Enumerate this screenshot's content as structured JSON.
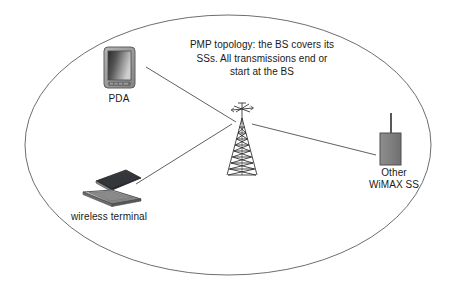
{
  "diagram": {
    "caption": "PMP topology: the BS covers its SSs. All transmissions end or start at the BS",
    "boundary": {
      "shape": "ellipse",
      "name": "coverage-area-ellipse",
      "stroke_color": "#6e6e6e",
      "fill_color": "#ffffff"
    },
    "nodes": [
      {
        "id": "pda",
        "label": "PDA",
        "icon": "pda-device-icon",
        "x": 119,
        "y": 68
      },
      {
        "id": "base-station",
        "label": "",
        "icon": "radio-tower-icon",
        "x": 242,
        "y": 145
      },
      {
        "id": "wireless-terminal",
        "label": "wireless terminal",
        "icon": "laptop-icon",
        "x": 109,
        "y": 188
      },
      {
        "id": "other-wimax-ss",
        "label": "Other\nWiMAX SS",
        "label_line1": "Other",
        "label_line2": "WiMAX SS",
        "icon": "subscriber-station-icon",
        "x": 391,
        "y": 147
      }
    ],
    "links": [
      {
        "id": "link-pda-bs",
        "from": "pda",
        "to": "base-station",
        "stroke_color": "#4d4d4d"
      },
      {
        "id": "link-terminal-bs",
        "from": "wireless-terminal",
        "to": "base-station",
        "stroke_color": "#4d4d4d"
      },
      {
        "id": "link-bs-wimax",
        "from": "base-station",
        "to": "other-wimax-ss",
        "stroke_color": "#4d4d4d"
      }
    ],
    "colors": {
      "line": "#4d4d4d",
      "ellipse": "#6e6e6e",
      "text": "#1a1a1a",
      "device_gray": "#808080",
      "device_dark": "#3a3a3a",
      "device_light": "#c8c8c8"
    }
  }
}
